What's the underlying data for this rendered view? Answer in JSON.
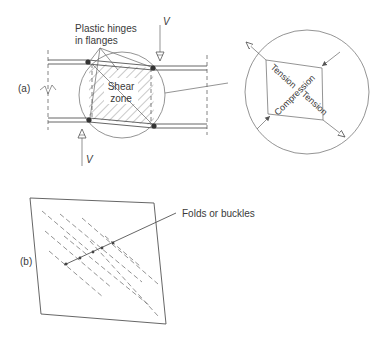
{
  "figure": {
    "part_a": {
      "label": "(a)",
      "hinges_label_line1": "Plastic hinges",
      "hinges_label_line2": "in flanges",
      "shear_label_line1": "Shear",
      "shear_label_line2": "zone",
      "load_top": "V",
      "load_bottom": "V",
      "detail": {
        "tension_1": "Tension",
        "compression": "Compression",
        "tension_2": "Tension"
      }
    },
    "part_b": {
      "label": "(b)",
      "folds_label": "Folds or buckles"
    }
  },
  "colors": {
    "ink": "#3a3a3a",
    "line": "#555555",
    "background": "#ffffff"
  }
}
